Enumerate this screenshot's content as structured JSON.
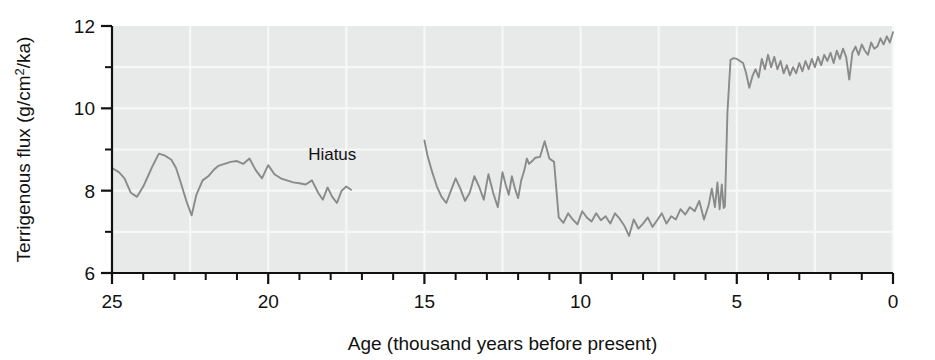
{
  "chart_data": {
    "type": "line",
    "title": "",
    "xlabel": "Age (thousand years before present)",
    "ylabel": "Terrigenous flux (g/cm2/ka)",
    "ylabel_parts": {
      "pre": "Terrigenous flux (g/cm",
      "sup": "2",
      "post": "/ka)"
    },
    "xlim": [
      25,
      0
    ],
    "ylim": [
      6,
      12
    ],
    "x_axis_reversed": true,
    "xticks": [
      25,
      20,
      15,
      10,
      5,
      0
    ],
    "xtick_labels": [
      "25",
      "20",
      "15",
      "10",
      "5",
      "0"
    ],
    "x_minor_tick_step": 1,
    "yticks": [
      6,
      8,
      10,
      12
    ],
    "ytick_labels": [
      "6",
      "8",
      "10",
      "12"
    ],
    "y_minor_ticks": [
      7,
      9,
      11
    ],
    "grid": "faint white gridlines on gray panel",
    "grid_x": [
      25,
      22.5,
      20,
      17.5,
      15,
      12.5,
      10,
      7.5,
      5,
      2.5,
      0
    ],
    "grid_y": [
      7,
      8,
      9,
      10,
      11
    ],
    "panel_color": "#e8e9e9",
    "line_color": "#8a8a8a",
    "axis_color": "#111111",
    "annotations": [
      {
        "text": "Hiatus",
        "x": 17.95,
        "y": 8.75
      }
    ],
    "legend": null,
    "series": [
      {
        "name": "Terrigenous flux (pre-hiatus)",
        "x": [
          25.0,
          24.78,
          24.6,
          24.4,
          24.2,
          24.0,
          23.85,
          23.7,
          23.5,
          23.3,
          23.1,
          22.95,
          22.8,
          22.62,
          22.45,
          22.3,
          22.1,
          21.92,
          21.75,
          21.6,
          21.4,
          21.2,
          21.0,
          20.8,
          20.6,
          20.4,
          20.2,
          20.0,
          19.8,
          19.6,
          19.4,
          19.2,
          19.0,
          18.8,
          18.6,
          18.4,
          18.25,
          18.1,
          17.95,
          17.8,
          17.65,
          17.5,
          17.35
        ],
        "values": [
          8.55,
          8.45,
          8.3,
          7.95,
          7.85,
          8.1,
          8.35,
          8.6,
          8.9,
          8.85,
          8.75,
          8.55,
          8.2,
          7.75,
          7.4,
          7.9,
          8.25,
          8.35,
          8.5,
          8.6,
          8.65,
          8.7,
          8.72,
          8.65,
          8.78,
          8.5,
          8.3,
          8.62,
          8.4,
          8.3,
          8.25,
          8.2,
          8.18,
          8.15,
          8.25,
          7.95,
          7.78,
          8.08,
          7.85,
          7.7,
          8.0,
          8.1,
          8.02
        ]
      },
      {
        "name": "Terrigenous flux (post-hiatus)",
        "x": [
          15.0,
          14.9,
          14.75,
          14.6,
          14.45,
          14.3,
          14.15,
          14.0,
          13.85,
          13.7,
          13.55,
          13.4,
          13.25,
          13.1,
          12.95,
          12.8,
          12.65,
          12.5,
          12.4,
          12.3,
          12.2,
          12.1,
          12.0,
          11.9,
          11.8,
          11.72,
          11.65,
          11.55,
          11.45,
          11.3,
          11.15,
          11.0,
          10.85,
          10.7,
          10.55,
          10.4,
          10.25,
          10.1,
          9.95,
          9.8,
          9.65,
          9.5,
          9.35,
          9.2,
          9.05,
          8.9,
          8.75,
          8.6,
          8.45,
          8.3,
          8.15,
          8.0,
          7.85,
          7.7,
          7.55,
          7.4,
          7.25,
          7.1,
          6.95,
          6.8,
          6.65,
          6.5,
          6.35,
          6.2,
          6.05,
          5.9,
          5.8,
          5.7,
          5.62,
          5.55,
          5.48,
          5.42,
          5.38,
          5.3,
          5.2,
          5.1,
          5.0,
          4.9,
          4.8,
          4.7,
          4.6,
          4.5,
          4.4,
          4.3,
          4.2,
          4.1,
          4.0,
          3.9,
          3.8,
          3.7,
          3.6,
          3.5,
          3.4,
          3.3,
          3.2,
          3.1,
          3.0,
          2.9,
          2.8,
          2.7,
          2.6,
          2.5,
          2.4,
          2.3,
          2.2,
          2.1,
          2.0,
          1.9,
          1.8,
          1.7,
          1.6,
          1.5,
          1.4,
          1.3,
          1.2,
          1.1,
          1.0,
          0.9,
          0.8,
          0.7,
          0.6,
          0.5,
          0.4,
          0.3,
          0.2,
          0.1,
          0.0
        ],
        "values": [
          9.22,
          8.85,
          8.45,
          8.1,
          7.85,
          7.7,
          8.0,
          8.3,
          8.05,
          7.75,
          7.95,
          8.35,
          8.1,
          7.78,
          8.4,
          7.95,
          7.6,
          8.45,
          8.15,
          7.9,
          8.35,
          8.05,
          7.82,
          8.25,
          8.5,
          8.78,
          8.65,
          8.72,
          8.8,
          8.82,
          9.2,
          8.78,
          8.7,
          7.35,
          7.22,
          7.45,
          7.3,
          7.18,
          7.5,
          7.35,
          7.25,
          7.45,
          7.28,
          7.38,
          7.2,
          7.45,
          7.32,
          7.15,
          6.9,
          7.3,
          7.08,
          7.2,
          7.35,
          7.12,
          7.28,
          7.45,
          7.2,
          7.38,
          7.3,
          7.55,
          7.42,
          7.6,
          7.5,
          7.75,
          7.3,
          7.65,
          8.05,
          7.6,
          8.2,
          7.55,
          8.15,
          7.58,
          7.62,
          9.9,
          11.18,
          11.22,
          11.2,
          11.15,
          11.1,
          10.85,
          10.5,
          10.78,
          10.95,
          10.75,
          11.2,
          10.95,
          11.3,
          11.0,
          11.25,
          10.95,
          11.15,
          10.85,
          11.05,
          10.8,
          11.0,
          10.85,
          11.1,
          10.9,
          11.15,
          10.95,
          11.2,
          11.0,
          11.25,
          11.05,
          11.3,
          11.15,
          11.35,
          11.1,
          11.4,
          11.2,
          11.45,
          11.25,
          10.7,
          11.35,
          11.5,
          11.3,
          11.55,
          11.4,
          11.3,
          11.6,
          11.45,
          11.5,
          11.7,
          11.55,
          11.75,
          11.6,
          11.85
        ]
      }
    ]
  }
}
